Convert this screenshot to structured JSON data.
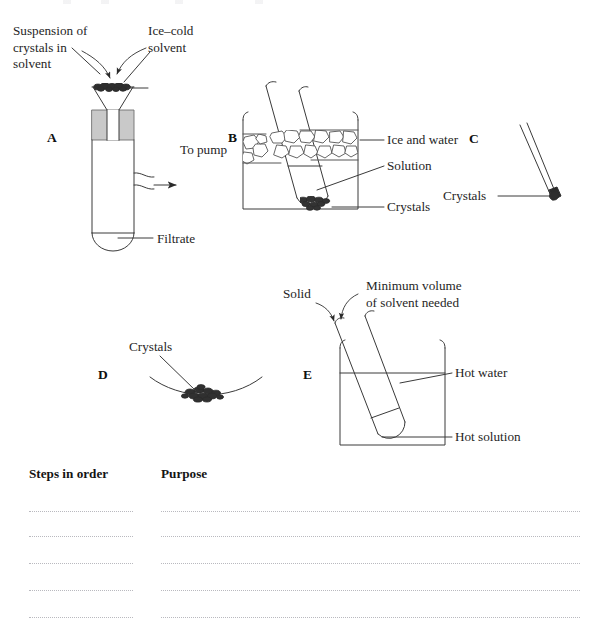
{
  "figure": {
    "title_hidden_top_fragment": "",
    "panels": [
      {
        "id": "A",
        "marker": "A",
        "name": "vacuum-filtration-apparatus",
        "labels": [
          {
            "name": "suspension-of-crystals-label",
            "text": "Suspension of\ncrystals in\nsolvent"
          },
          {
            "name": "ice-cold-solvent-label",
            "text": "Ice–cold\nsolvent"
          },
          {
            "name": "to-pump-label",
            "text": "To pump"
          },
          {
            "name": "filtrate-label",
            "text": "Filtrate"
          }
        ]
      },
      {
        "id": "B",
        "marker": "B",
        "name": "ice-water-bath-cooling",
        "labels": [
          {
            "name": "ice-and-water-label",
            "text": "Ice and water"
          },
          {
            "name": "solution-label",
            "text": "Solution"
          },
          {
            "name": "crystals-label",
            "text": "Crystals"
          }
        ]
      },
      {
        "id": "C",
        "marker": "C",
        "name": "spatula-with-crystals",
        "labels": [
          {
            "name": "crystals-label",
            "text": "Crystals"
          }
        ]
      },
      {
        "id": "D",
        "marker": "D",
        "name": "crystals-on-watch-glass",
        "labels": [
          {
            "name": "crystals-label",
            "text": "Crystals"
          }
        ]
      },
      {
        "id": "E",
        "marker": "E",
        "name": "hot-water-bath-dissolving",
        "labels": [
          {
            "name": "solid-label",
            "text": "Solid"
          },
          {
            "name": "minimum-volume-label",
            "text": "Minimum volume\nof solvent needed"
          },
          {
            "name": "hot-water-label",
            "text": "Hot water"
          },
          {
            "name": "hot-solution-label",
            "text": "Hot solution"
          }
        ]
      }
    ]
  },
  "answer_table": {
    "columns": [
      {
        "name": "steps-in-order-header",
        "label": "Steps in order"
      },
      {
        "name": "purpose-header",
        "label": "Purpose"
      }
    ],
    "row_count": 5,
    "rows": [
      {
        "steps": "",
        "purpose": ""
      },
      {
        "steps": "",
        "purpose": ""
      },
      {
        "steps": "",
        "purpose": ""
      },
      {
        "steps": "",
        "purpose": ""
      },
      {
        "steps": "",
        "purpose": ""
      }
    ]
  },
  "colors": {
    "ink": "#252525",
    "line": "#3a3a3a",
    "stopper_fill": "#c9c9c9",
    "crystal_dark": "#2b2b2b",
    "dotted_rule": "#b9b9bf",
    "background": "#ffffff"
  }
}
